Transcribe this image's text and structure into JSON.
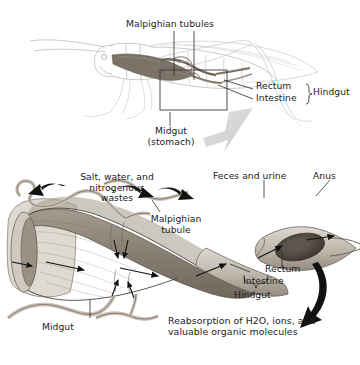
{
  "figure": {
    "title_alt": "Insect digestive and excretory system — grasshopper gut and Malpighian tubules",
    "background": "#ffffff",
    "ink": "#1c1c1c",
    "tube_fill": "#b9b3a8",
    "gut_fill": "#8b8378",
    "arrow_gray": "#cfcfcf",
    "arrow_black": "#111111"
  },
  "top_panel": {
    "labels": {
      "malpighian_tubules": "Malpighian tubules",
      "rectum": "Rectum",
      "intestine": "Intestine",
      "hindgut": "Hindgut",
      "midgut_line1": "Midgut",
      "midgut_line2": "(stomach)"
    }
  },
  "bottom_panel": {
    "labels": {
      "salt_line1": "Salt, water, and",
      "salt_line2": "nitrogenous",
      "salt_line3": "wastes",
      "malpighian_tubule_line1": "Malpighian",
      "malpighian_tubule_line2": "tubule",
      "feces_and_urine": "Feces and urine",
      "anus": "Anus",
      "rectum": "Rectum",
      "intestine": "Intestine",
      "hindgut": "Hindgut",
      "midgut": "Midgut",
      "reabsorption_line1_a": "Reabsorption of H",
      "reabsorption_line1_sub": "2",
      "reabsorption_line1_b": "O, ions, and",
      "reabsorption_line2": "valuable organic molecules"
    }
  }
}
